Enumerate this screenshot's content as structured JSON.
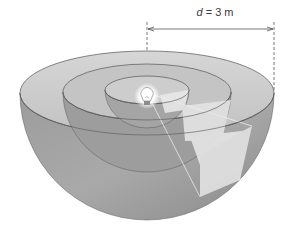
{
  "diagram": {
    "type": "nested-hemispheres-point-source",
    "dimension_label": {
      "variable": "d",
      "equals": "=",
      "value": "3 m"
    },
    "source": {
      "icon": "lightbulb-icon",
      "description": "light bulb at common center"
    },
    "shells": [
      {
        "name": "inner-hemisphere",
        "relative_radius": 1
      },
      {
        "name": "middle-hemisphere",
        "relative_radius": 2
      },
      {
        "name": "outer-hemisphere",
        "relative_radius": 3
      }
    ],
    "colors": {
      "background": "#ffffff",
      "rim_top": "#c9c9c9",
      "shell_dark": "#8f8f8f",
      "shell_mid": "#a8a8a8",
      "highlight_patch": "#e6e6e6",
      "outline": "#555555",
      "text": "#3a3a3a"
    }
  }
}
